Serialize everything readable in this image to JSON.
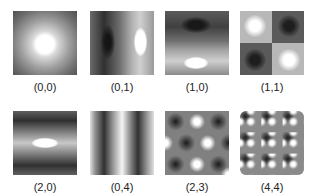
{
  "figure": {
    "panels": [
      {
        "label": "(0,0)",
        "mode": [
          0,
          0
        ]
      },
      {
        "label": "(0,1)",
        "mode": [
          0,
          1
        ]
      },
      {
        "label": "(1,0)",
        "mode": [
          1,
          0
        ]
      },
      {
        "label": "(1,1)",
        "mode": [
          1,
          1
        ]
      },
      {
        "label": "(2,0)",
        "mode": [
          2,
          0
        ]
      },
      {
        "label": "(0,4)",
        "mode": [
          0,
          4
        ]
      },
      {
        "label": "(2,3)",
        "mode": [
          2,
          3
        ]
      },
      {
        "label": "(4,4)",
        "mode": [
          4,
          4
        ]
      }
    ]
  }
}
